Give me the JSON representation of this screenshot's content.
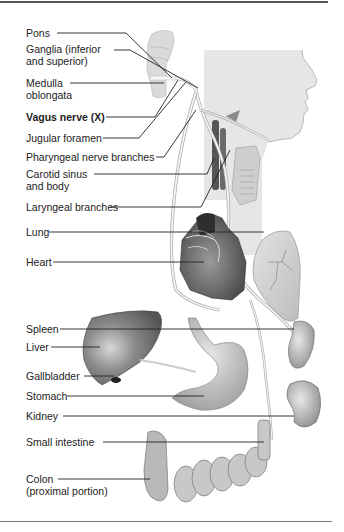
{
  "figure": {
    "colors": {
      "frame": "#555555",
      "leader_line": "#222222",
      "text": "#222222",
      "head_silhouette": "#e6e6e6",
      "organ_dark": "#555555",
      "organ_mid": "#9a9a9a",
      "organ_light": "#d0d0d0",
      "nerve": "#f4f4f4"
    },
    "labels": [
      {
        "id": "pons",
        "text": "Pons",
        "x": 26,
        "y": 30
      },
      {
        "id": "ganglia",
        "text": "Ganglia (inferior",
        "x": 26,
        "y": 46,
        "line2": "and superior)"
      },
      {
        "id": "medulla",
        "text": "Medulla",
        "x": 26,
        "y": 79,
        "line2": "oblongata"
      },
      {
        "id": "vagus",
        "text": "Vagus nerve (X)",
        "x": 26,
        "y": 113,
        "bold": true
      },
      {
        "id": "jugular",
        "text": "Jugular foramen",
        "x": 26,
        "y": 134
      },
      {
        "id": "pharyngeal",
        "text": "Pharyngeal nerve branches",
        "x": 26,
        "y": 153
      },
      {
        "id": "carotid",
        "text": "Carotid sinus",
        "x": 26,
        "y": 171,
        "line2": "and body"
      },
      {
        "id": "laryngeal",
        "text": "Laryngeal branches",
        "x": 26,
        "y": 203
      },
      {
        "id": "lung",
        "text": "Lung",
        "x": 26,
        "y": 229
      },
      {
        "id": "heart",
        "text": "Heart",
        "x": 26,
        "y": 259
      },
      {
        "id": "spleen",
        "text": "Spleen",
        "x": 26,
        "y": 326
      },
      {
        "id": "liver",
        "text": "Liver",
        "x": 26,
        "y": 343
      },
      {
        "id": "gallbladder",
        "text": "Gallbladder",
        "x": 26,
        "y": 372
      },
      {
        "id": "stomach",
        "text": "Stomach",
        "x": 26,
        "y": 392
      },
      {
        "id": "kidney",
        "text": "Kidney",
        "x": 26,
        "y": 413
      },
      {
        "id": "small_intestine",
        "text": "Small intestine",
        "x": 26,
        "y": 438
      },
      {
        "id": "colon",
        "text": "Colon",
        "x": 26,
        "y": 476,
        "line2": "(proximal portion)"
      }
    ]
  }
}
